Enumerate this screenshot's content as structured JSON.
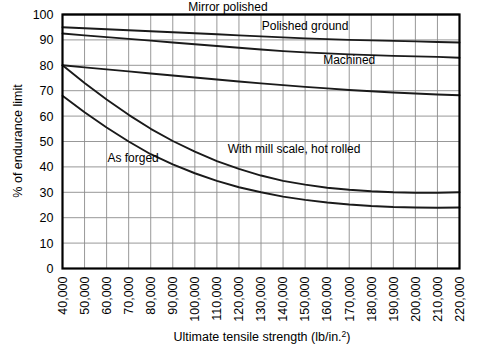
{
  "chart_data": {
    "type": "line",
    "title": "",
    "xlabel": "Ultimate tensile strength (lb/in.²)",
    "ylabel": "% of endurance limit",
    "xlim": [
      40000,
      220000
    ],
    "ylim": [
      0,
      100
    ],
    "grid": true,
    "legend_position": "inline-annotations",
    "x_tick_labels": [
      "40,000",
      "50,000",
      "60,000",
      "70,000",
      "80,000",
      "90,000",
      "100,000",
      "110,000",
      "120,000",
      "130,000",
      "140,000",
      "150,000",
      "160,000",
      "170,000",
      "180,000",
      "190,000",
      "200,000",
      "210,000",
      "220,000"
    ],
    "x_tick_values": [
      40000,
      50000,
      60000,
      70000,
      80000,
      90000,
      100000,
      110000,
      120000,
      130000,
      140000,
      150000,
      160000,
      170000,
      180000,
      190000,
      200000,
      210000,
      220000
    ],
    "y_tick_labels": [
      "0",
      "10",
      "20",
      "30",
      "40",
      "50",
      "60",
      "70",
      "80",
      "90",
      "100"
    ],
    "y_tick_values": [
      0,
      10,
      20,
      30,
      40,
      50,
      60,
      70,
      80,
      90,
      100
    ],
    "x": [
      40000,
      50000,
      60000,
      70000,
      80000,
      90000,
      100000,
      110000,
      120000,
      130000,
      140000,
      150000,
      160000,
      170000,
      180000,
      190000,
      200000,
      210000,
      220000
    ],
    "series": [
      {
        "name": "Mirror polished",
        "label": "Mirror polished",
        "values": [
          95.0,
          94.6,
          94.2,
          93.8,
          93.4,
          93.0,
          92.6,
          92.2,
          91.8,
          91.4,
          91.0,
          90.6,
          90.3,
          90.0,
          89.8,
          89.6,
          89.4,
          89.2,
          89.0
        ]
      },
      {
        "name": "Polished ground",
        "label": "Polished ground",
        "values": [
          92.5,
          91.8,
          91.1,
          90.4,
          89.7,
          89.0,
          88.3,
          87.6,
          86.9,
          86.2,
          85.6,
          85.1,
          84.7,
          84.3,
          84.0,
          83.7,
          83.5,
          83.3,
          83.0
        ]
      },
      {
        "name": "Machined",
        "label": "Machined",
        "values": [
          80.0,
          79.2,
          78.4,
          77.6,
          76.8,
          76.0,
          75.2,
          74.4,
          73.6,
          72.9,
          72.2,
          71.5,
          70.9,
          70.3,
          69.8,
          69.3,
          68.9,
          68.5,
          68.2
        ]
      },
      {
        "name": "With mill scale, hot rolled",
        "label": "With mill scale, hot rolled",
        "values": [
          80.0,
          73.0,
          66.5,
          60.5,
          55.0,
          50.2,
          46.0,
          42.3,
          39.2,
          36.6,
          34.5,
          33.0,
          31.8,
          31.0,
          30.4,
          30.0,
          29.8,
          29.8,
          30.0
        ]
      },
      {
        "name": "As forged",
        "label": "As forged",
        "values": [
          68.0,
          61.5,
          55.5,
          50.0,
          45.0,
          41.0,
          37.5,
          34.5,
          32.0,
          30.0,
          28.3,
          27.0,
          26.0,
          25.2,
          24.6,
          24.2,
          24.0,
          23.9,
          24.0
        ]
      }
    ],
    "annotations": [
      {
        "text": "Mirror polished",
        "x": 115000,
        "y": 101.5
      },
      {
        "text": "Polished ground",
        "x": 150000,
        "y": 94.0
      },
      {
        "text": "Machined",
        "x": 170000,
        "y": 80.5
      },
      {
        "text": "With mill scale, hot rolled",
        "x": 145000,
        "y": 45.5
      },
      {
        "text": "As forged",
        "x": 72000,
        "y": 42.0
      }
    ],
    "colors": {
      "curve": "#1a1a1a",
      "grid": "#8c8c8c",
      "axis": "#000000",
      "background": "#ffffff"
    }
  }
}
